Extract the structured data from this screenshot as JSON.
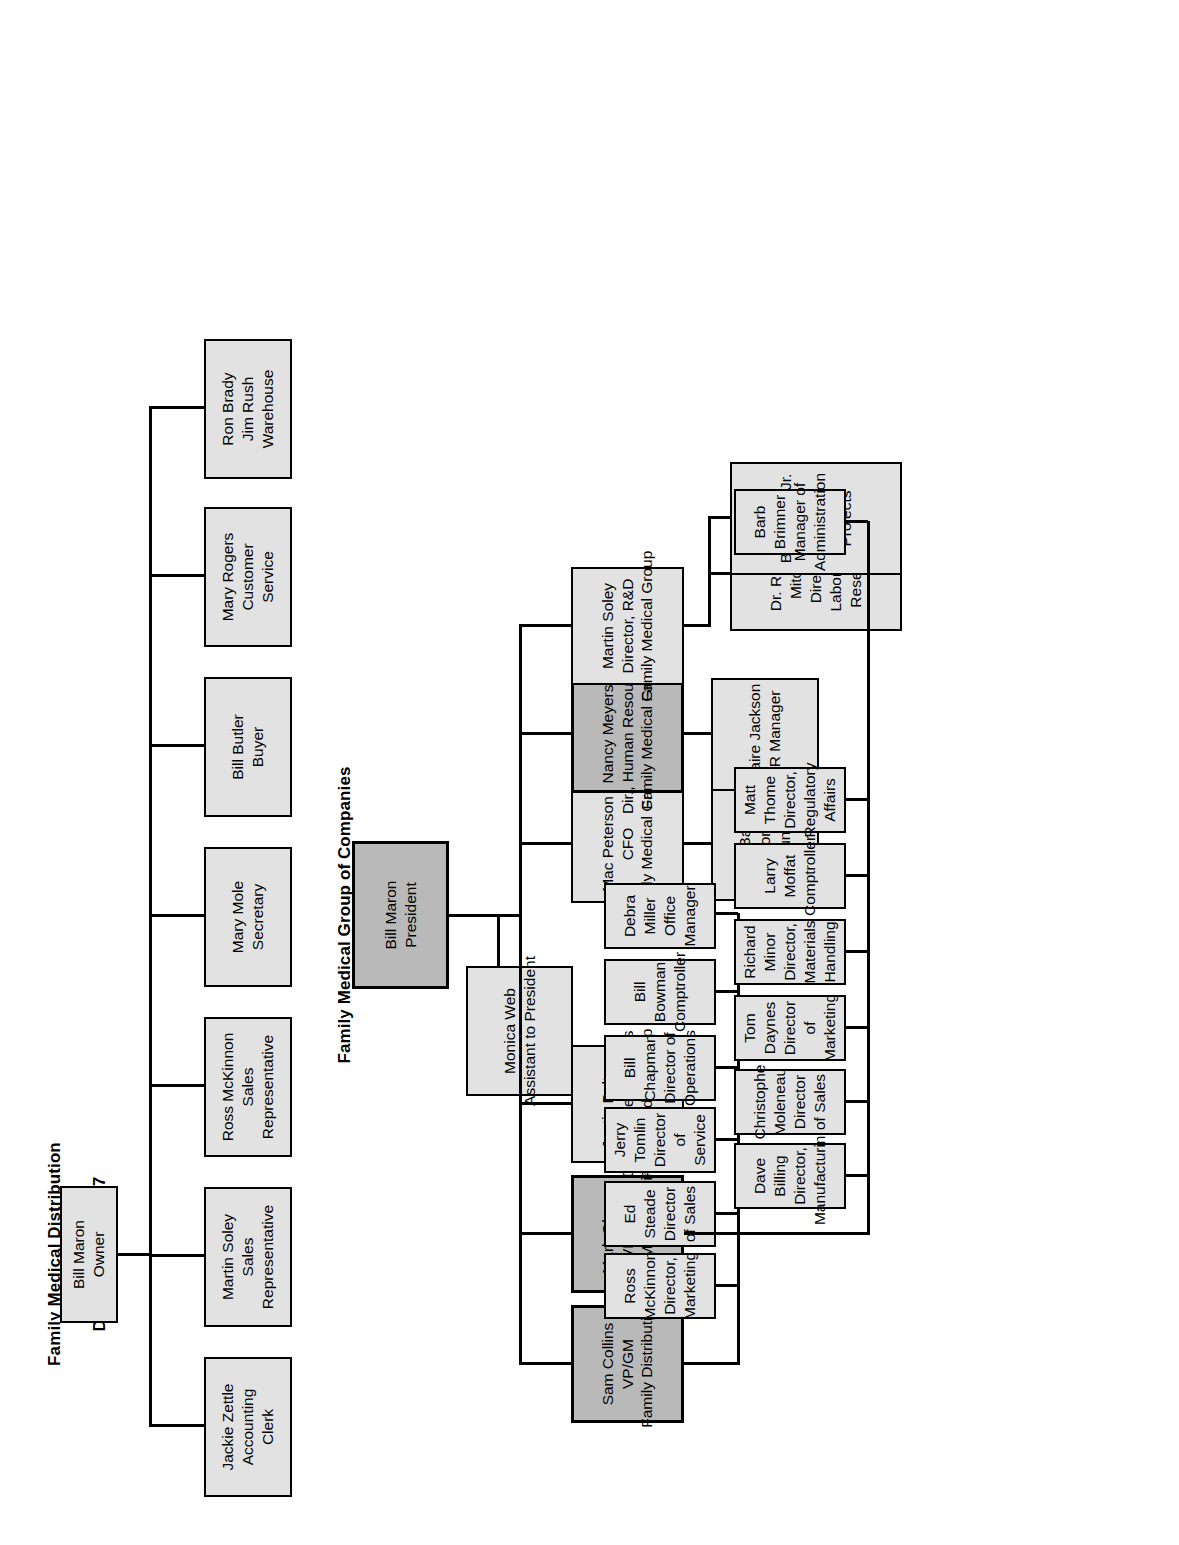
{
  "document": {
    "orientation": "rotated-90-ccw",
    "charts": [
      {
        "id": "chart-1967",
        "title_line1": "Family Medical Distribution",
        "title_line2": "December 31, 1967",
        "root": {
          "lines": [
            "Bill Maron",
            "Owner"
          ],
          "shade": "light"
        },
        "reports": [
          {
            "lines": [
              "Jackie Zettle",
              "Accounting",
              "Clerk"
            ],
            "shade": "light"
          },
          {
            "lines": [
              "Martin Soley",
              "Sales",
              "Representative"
            ],
            "shade": "light"
          },
          {
            "lines": [
              "Ross McKinnon",
              "Sales",
              "Representative"
            ],
            "shade": "light"
          },
          {
            "lines": [
              "Mary Mole",
              "Secretary"
            ],
            "shade": "light"
          },
          {
            "lines": [
              "Bill Butler",
              "Buyer"
            ],
            "shade": "light"
          },
          {
            "lines": [
              "Mary Rogers",
              "Customer",
              "Service"
            ],
            "shade": "light"
          },
          {
            "lines": [
              "Ron Brady",
              "Jim Rush",
              "Warehouse"
            ],
            "shade": "light"
          }
        ]
      },
      {
        "id": "chart-1999",
        "title_line1": "Family Medical Group of Companies",
        "title_line2": "April 30, 1999",
        "root": {
          "lines": [
            "Bill Maron",
            "President"
          ],
          "shade": "dark"
        },
        "assistant": {
          "lines": [
            "Monica Web",
            "Assistant to President"
          ],
          "shade": "light"
        },
        "reports": [
          {
            "lines": [
              "Sam Collins",
              "VP/GM",
              "Family Distribution"
            ],
            "shade": "dark"
          },
          {
            "lines": [
              "Mark Olsen",
              "VP/GM",
              "Family Manufacturing"
            ],
            "shade": "dark"
          },
          {
            "lines": [
              "Justin Balton",
              "Director, Legal Affairs",
              "Family Medical Group"
            ],
            "shade": "light"
          },
          {
            "lines": [
              "Mac Peterson",
              "CFO",
              "Family Medical Group"
            ],
            "shade": "light"
          },
          {
            "lines": [
              "Nancy Meyers",
              "Dir., Human Resources",
              "Family Medical Group"
            ],
            "shade": "dark"
          },
          {
            "lines": [
              "Martin Soley",
              "Director, R&D",
              "Family Medical Group"
            ],
            "shade": "light"
          }
        ],
        "sam_collins_reports": [
          {
            "lines": [
              "Ross McKinnon",
              "Director, Marketing"
            ],
            "shade": "light"
          },
          {
            "lines": [
              "Ed Steade",
              "Director of Sales"
            ],
            "shade": "light"
          },
          {
            "lines": [
              "Jerry Tomlin",
              "Director of Service"
            ],
            "shade": "light"
          },
          {
            "lines": [
              "Bill Chapman",
              "Director of Operations"
            ],
            "shade": "light"
          },
          {
            "lines": [
              "Bill Bowman",
              "Comptroller"
            ],
            "shade": "light"
          },
          {
            "lines": [
              "Debra Miller",
              "Office Manager"
            ],
            "shade": "light"
          }
        ],
        "mark_olsen_reports": [
          {
            "lines": [
              "Dave Billing",
              "Director, Manufacturing"
            ],
            "shade": "light"
          },
          {
            "lines": [
              "Christophe Moleneau",
              "Director of Sales"
            ],
            "shade": "light"
          },
          {
            "lines": [
              "Tom Daynes",
              "Director of Marketing"
            ],
            "shade": "light"
          },
          {
            "lines": [
              "Richard Minor",
              "Director, Materials Handling"
            ],
            "shade": "light"
          },
          {
            "lines": [
              "Larry Moffat",
              "Comptroller"
            ],
            "shade": "light"
          },
          {
            "lines": [
              "Matt Thome",
              "Director, Regulatory Affairs"
            ],
            "shade": "light"
          },
          {
            "lines": [
              "Barb Brimner",
              "Manager of Administration"
            ],
            "shade": "light"
          }
        ],
        "mac_peterson_reports": [
          {
            "lines": [
              "Emily Bakker",
              "Corporate Accountant"
            ],
            "shade": "light"
          }
        ],
        "nancy_meyers_reports": [
          {
            "lines": [
              "Claire Jackson",
              "HR Manager"
            ],
            "shade": "light"
          }
        ],
        "martin_soley_reports": [
          {
            "lines": [
              "Dr. Roland Mitchel",
              "Director, Laboratory Research"
            ],
            "shade": "light"
          },
          {
            "lines": [
              "Bill Maron Jr.",
              "Director, Special Projects"
            ],
            "shade": "light"
          }
        ]
      }
    ],
    "colors": {
      "box_light": "#e2e2e2",
      "box_dark": "#b9b9b9",
      "line": "#000000",
      "background": "#ffffff"
    }
  }
}
